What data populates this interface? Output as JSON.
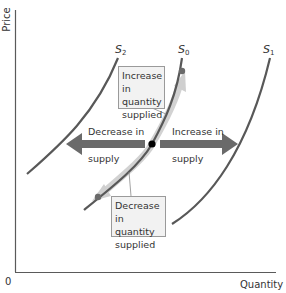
{
  "figure": {
    "type": "supply-shift-diagram",
    "axes": {
      "y_label": "Price",
      "x_label": "Quantity",
      "origin_label": "0"
    },
    "curves": [
      {
        "id": "S2",
        "label_main": "S",
        "label_sub": "2"
      },
      {
        "id": "S0",
        "label_main": "S",
        "label_sub": "0"
      },
      {
        "id": "S1",
        "label_main": "S",
        "label_sub": "1"
      }
    ],
    "annotations": {
      "increase_qs": {
        "line1": "Increase in",
        "line2": "quantity",
        "line3": "supplied"
      },
      "decrease_qs": {
        "line1": "Decrease in",
        "line2": "quantity",
        "line3": "supplied"
      },
      "decrease_supply": {
        "line1": "Decrease in",
        "line2": "supply"
      },
      "increase_supply": {
        "line1": "Increase in",
        "line2": "supply"
      }
    },
    "colors": {
      "curve": "#585858",
      "arrow": "#6a6a6a",
      "highlight_band": "#c8c8c8",
      "axis": "#5a5a5a",
      "box_bg": "#f2f2f2",
      "box_border": "#9a9a9a",
      "point": "#000000"
    }
  }
}
